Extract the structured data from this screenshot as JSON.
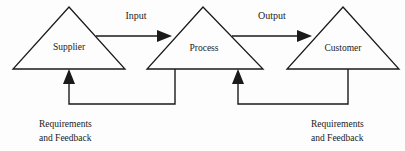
{
  "diagram": {
    "background_color": "#fdfdfd",
    "line_color": "#1a1a1a",
    "nodes": [
      {
        "id": "supplier",
        "label": "Supplier",
        "shape": "triangle",
        "apex_x": 69,
        "apex_y": 7,
        "base_left_x": 13,
        "base_right_x": 125,
        "base_y": 69,
        "label_x": 69,
        "label_y": 50
      },
      {
        "id": "process",
        "label": "Process",
        "shape": "triangle",
        "apex_x": 203,
        "apex_y": 7,
        "base_left_x": 147,
        "base_right_x": 263,
        "base_y": 69,
        "label_x": 204,
        "label_y": 51
      },
      {
        "id": "customer",
        "label": "Customer",
        "shape": "triangle",
        "apex_x": 343,
        "apex_y": 7,
        "base_left_x": 287,
        "base_right_x": 399,
        "base_y": 69,
        "label_x": 343,
        "label_y": 51
      }
    ],
    "flows": [
      {
        "id": "input",
        "label": "Input",
        "from": "supplier",
        "to": "process",
        "label_x": 136,
        "label_y": 19,
        "line_y": 36,
        "start_x": 96,
        "end_x": 160
      },
      {
        "id": "output",
        "label": "Output",
        "from": "process",
        "to": "customer",
        "label_x": 272,
        "label_y": 19,
        "line_y": 36,
        "start_x": 232,
        "end_x": 300
      }
    ],
    "feedback_loops": [
      {
        "id": "feedback-process-to-supplier",
        "from": "process",
        "to": "supplier",
        "source_x": 175,
        "target_x": 69,
        "top_y": 69,
        "bottom_y": 104,
        "arrow_tip_y": 70
      },
      {
        "id": "feedback-customer-to-process",
        "from": "customer",
        "to": "process",
        "source_x": 348,
        "target_x": 238,
        "top_y": 69,
        "bottom_y": 104,
        "arrow_tip_y": 70
      }
    ],
    "captions": [
      {
        "id": "caption-left",
        "line1": "Requirements",
        "line2": "and Feedback",
        "x": 39,
        "y1": 127,
        "y2": 141
      },
      {
        "id": "caption-right",
        "line1": "Requirements",
        "line2": "and Feedback",
        "x": 311,
        "y1": 127,
        "y2": 141
      }
    ]
  }
}
